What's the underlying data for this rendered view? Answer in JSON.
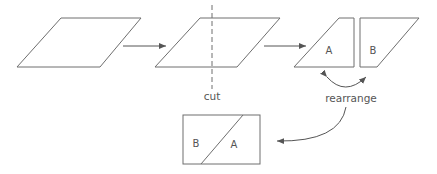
{
  "diagram": {
    "colors": {
      "stroke": "#6e6e6e",
      "text": "#555555",
      "background": "#ffffff"
    },
    "steps": [
      {
        "id": "original",
        "shape": "parallelogram"
      },
      {
        "id": "cut",
        "shape": "parallelogram with dashed cut line",
        "label": "cut"
      },
      {
        "id": "pieces",
        "shape": "two pieces",
        "pieces": [
          "A",
          "B"
        ],
        "label": "rearrange"
      },
      {
        "id": "result",
        "shape": "rectangle",
        "pieces": [
          "B",
          "A"
        ]
      }
    ],
    "labels": {
      "cut": "cut",
      "rearrange": "rearrange",
      "piece_a": "A",
      "piece_b": "B",
      "result_b": "B",
      "result_a": "A"
    }
  }
}
